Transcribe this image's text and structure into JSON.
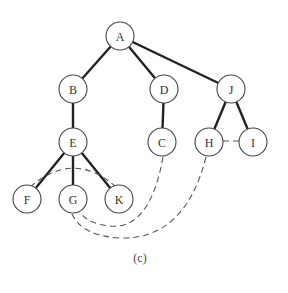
{
  "diagram": {
    "type": "depth-first search spanning tree with back edges",
    "caption": "(c)",
    "node_radius": 14,
    "nodes": [
      {
        "id": "A",
        "label": "A",
        "x": 120,
        "y": 36
      },
      {
        "id": "B",
        "label": "B",
        "x": 73,
        "y": 89
      },
      {
        "id": "D",
        "label": "D",
        "x": 164,
        "y": 89
      },
      {
        "id": "J",
        "label": "J",
        "x": 231,
        "y": 89
      },
      {
        "id": "E",
        "label": "E",
        "x": 73,
        "y": 142
      },
      {
        "id": "C",
        "label": "C",
        "x": 162,
        "y": 142
      },
      {
        "id": "H",
        "label": "H",
        "x": 209,
        "y": 142
      },
      {
        "id": "I",
        "label": "I",
        "x": 253,
        "y": 142
      },
      {
        "id": "F",
        "label": "F",
        "x": 27,
        "y": 199
      },
      {
        "id": "G",
        "label": "G",
        "x": 73,
        "y": 199
      },
      {
        "id": "K",
        "label": "K",
        "x": 119,
        "y": 199
      }
    ],
    "tree_edges": [
      [
        "A",
        "B"
      ],
      [
        "A",
        "D"
      ],
      [
        "A",
        "J"
      ],
      [
        "B",
        "E"
      ],
      [
        "D",
        "C"
      ],
      [
        "J",
        "H"
      ],
      [
        "J",
        "I"
      ],
      [
        "E",
        "F"
      ],
      [
        "E",
        "G"
      ],
      [
        "E",
        "K"
      ]
    ],
    "back_edges": [
      {
        "from": "H",
        "to": "I",
        "path": "M223,141 L239,141"
      },
      {
        "from": "F",
        "to": "K",
        "path": "M30,187 Q73,150 115,186"
      },
      {
        "from": "C",
        "to": "G",
        "path": "M163,157 Q150,230 110,226 Q88,224 80,212"
      },
      {
        "from": "H",
        "to": "G",
        "path": "M206,157 Q185,240 120,238 Q82,236 72,214"
      }
    ],
    "colors": {
      "node_stroke": "#444444",
      "tree_edge": "#222222",
      "back_edge": "#555555",
      "background": "#ffffff"
    }
  }
}
